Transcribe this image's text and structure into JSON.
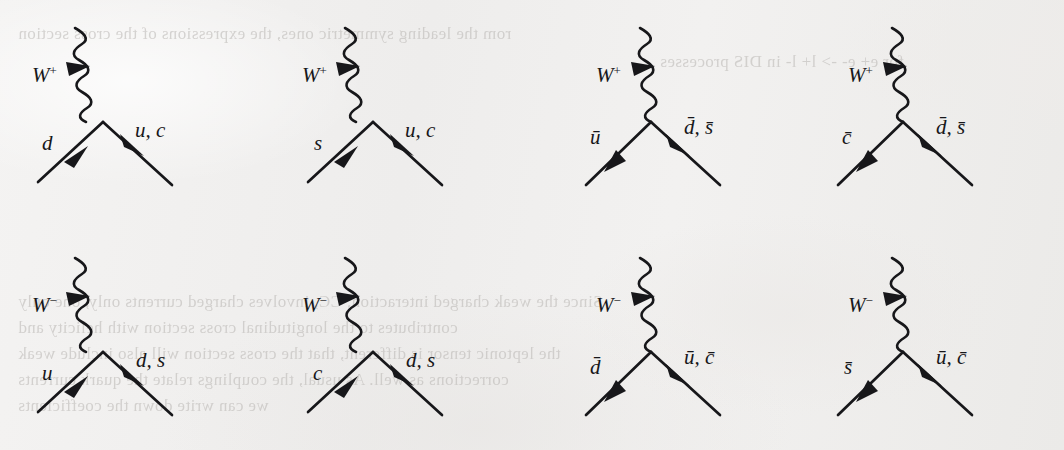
{
  "page": {
    "kind": "feynman-diagram-figure",
    "width": 1064,
    "height": 450,
    "background_color": "#f1f0ef",
    "ink_color": "#17171a",
    "bleed_text_color": "#b9b6b3"
  },
  "bleed_through_text": [
    {
      "text": "rom the leading symmetric ones, the expressions of the cross section",
      "x": 18,
      "y": 24
    },
    {
      "text": "for e+ e- -> l+ l- in DIS processes",
      "x": 660,
      "y": 52
    },
    {
      "text": "Since the weak charged interaction, CC, involves charged currents only, one only",
      "x": 18,
      "y": 292
    },
    {
      "text": "contributes to the longitudinal cross section with helicity and",
      "x": 18,
      "y": 318
    },
    {
      "text": "the leptonic tensor is different, that the cross section will also include weak",
      "x": 18,
      "y": 344
    },
    {
      "text": "corrections as well. As usual, the couplings relate the quark currents",
      "x": 18,
      "y": 370
    },
    {
      "text": "we can write down the coefficients",
      "x": 18,
      "y": 396
    }
  ],
  "figure": {
    "caption": "",
    "rows": 2,
    "columns": 4,
    "diagrams": [
      {
        "id": "d1",
        "boson": {
          "symbol": "W",
          "charge": "+",
          "label": "W+",
          "type": "wavy-propagator"
        },
        "incoming": {
          "label": "d",
          "bar": false,
          "direction": "into-vertex"
        },
        "outgoing": {
          "label": "u, c",
          "bar": false,
          "direction": "out-of-vertex"
        },
        "x": 20,
        "y": 22
      },
      {
        "id": "d2",
        "boson": {
          "symbol": "W",
          "charge": "+",
          "label": "W+",
          "type": "wavy-propagator"
        },
        "incoming": {
          "label": "s",
          "bar": false,
          "direction": "into-vertex"
        },
        "outgoing": {
          "label": "u, c",
          "bar": false,
          "direction": "out-of-vertex"
        },
        "x": 290,
        "y": 22
      },
      {
        "id": "d3",
        "boson": {
          "symbol": "W",
          "charge": "+",
          "label": "W+",
          "type": "wavy-propagator"
        },
        "incoming": {
          "label": "u",
          "bar": true,
          "direction": "out-of-vertex"
        },
        "outgoing": {
          "label": "d, s",
          "bar": true,
          "direction": "into-vertex"
        },
        "x": 560,
        "y": 22
      },
      {
        "id": "d4",
        "boson": {
          "symbol": "W",
          "charge": "+",
          "label": "W+",
          "type": "wavy-propagator"
        },
        "incoming": {
          "label": "c",
          "bar": true,
          "direction": "out-of-vertex"
        },
        "outgoing": {
          "label": "d, s",
          "bar": true,
          "direction": "into-vertex"
        },
        "x": 812,
        "y": 22
      },
      {
        "id": "d5",
        "boson": {
          "symbol": "W",
          "charge": "−",
          "label": "W-",
          "type": "wavy-propagator"
        },
        "incoming": {
          "label": "u",
          "bar": false,
          "direction": "into-vertex"
        },
        "outgoing": {
          "label": "d, s",
          "bar": false,
          "direction": "out-of-vertex"
        },
        "x": 20,
        "y": 252
      },
      {
        "id": "d6",
        "boson": {
          "symbol": "W",
          "charge": "−",
          "label": "W-",
          "type": "wavy-propagator"
        },
        "incoming": {
          "label": "c",
          "bar": false,
          "direction": "into-vertex"
        },
        "outgoing": {
          "label": "d, s",
          "bar": false,
          "direction": "out-of-vertex"
        },
        "x": 290,
        "y": 252
      },
      {
        "id": "d7",
        "boson": {
          "symbol": "W",
          "charge": "−",
          "label": "W-",
          "type": "wavy-propagator"
        },
        "incoming": {
          "label": "d",
          "bar": true,
          "direction": "out-of-vertex"
        },
        "outgoing": {
          "label": "u, c",
          "bar": true,
          "direction": "into-vertex"
        },
        "x": 560,
        "y": 252
      },
      {
        "id": "d8",
        "boson": {
          "symbol": "W",
          "charge": "−",
          "label": "W-",
          "type": "wavy-propagator"
        },
        "incoming": {
          "label": "s",
          "bar": true,
          "direction": "out-of-vertex"
        },
        "outgoing": {
          "label": "u, c",
          "bar": true,
          "direction": "into-vertex"
        },
        "x": 812,
        "y": 252
      }
    ]
  }
}
